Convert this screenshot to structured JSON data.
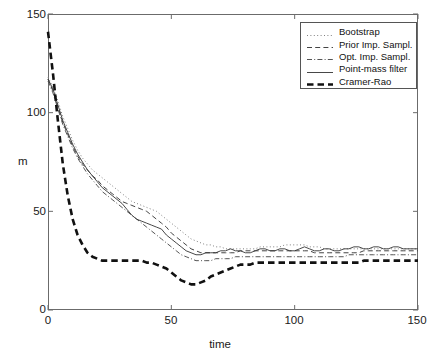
{
  "chart_data": {
    "type": "line",
    "title": "",
    "xlabel": "time",
    "ylabel": "m",
    "xlim": [
      0,
      150
    ],
    "ylim": [
      0,
      150
    ],
    "xticks": [
      0,
      50,
      100,
      150
    ],
    "yticks": [
      0,
      50,
      100,
      150
    ],
    "grid": false,
    "legend_position": "top-right",
    "x": [
      0,
      2,
      4,
      6,
      8,
      10,
      12,
      14,
      16,
      18,
      20,
      22,
      24,
      26,
      28,
      30,
      32,
      34,
      36,
      38,
      40,
      42,
      44,
      46,
      48,
      50,
      52,
      54,
      56,
      58,
      60,
      62,
      64,
      66,
      68,
      70,
      72,
      74,
      76,
      78,
      80,
      82,
      84,
      86,
      88,
      90,
      92,
      94,
      96,
      98,
      100,
      102,
      104,
      106,
      108,
      110,
      112,
      114,
      116,
      118,
      120,
      122,
      124,
      126,
      128,
      130,
      132,
      134,
      136,
      138,
      140,
      142,
      144,
      146,
      148,
      150
    ],
    "series": [
      {
        "name": "Bootstrap",
        "style": "dotted",
        "color": "#808080",
        "values": [
          118,
          113,
          106,
          98,
          92,
          86,
          81,
          77,
          74,
          71,
          69,
          67,
          65,
          63,
          61,
          59,
          57,
          55,
          54,
          53,
          52,
          51,
          50,
          48,
          46,
          44,
          42,
          40,
          38,
          36,
          35,
          34,
          33,
          33,
          32,
          32,
          31,
          31,
          31,
          31,
          31,
          31,
          31,
          32,
          32,
          32,
          32,
          32,
          33,
          33,
          33,
          33,
          33,
          32,
          32,
          32,
          31,
          31,
          31,
          31,
          31,
          31,
          31,
          31,
          31,
          31,
          31,
          31,
          31,
          31,
          31,
          31,
          31,
          31,
          31,
          31
        ]
      },
      {
        "name": "Prior Imp. Sampl.",
        "style": "dashed",
        "color": "#444444",
        "values": [
          117,
          111,
          103,
          95,
          89,
          83,
          78,
          74,
          71,
          68,
          66,
          63,
          61,
          59,
          57,
          55,
          54,
          53,
          52,
          51,
          50,
          48,
          46,
          44,
          42,
          39,
          37,
          35,
          33,
          31,
          30,
          29,
          29,
          29,
          29,
          29,
          29,
          29,
          29,
          30,
          30,
          30,
          30,
          30,
          30,
          30,
          30,
          30,
          30,
          30,
          30,
          30,
          30,
          30,
          29,
          29,
          29,
          29,
          29,
          29,
          29,
          29,
          29,
          29,
          30,
          30,
          30,
          30,
          30,
          30,
          30,
          30,
          30,
          30,
          30,
          30
        ]
      },
      {
        "name": "Opt. Imp. Sampl.",
        "style": "dashdot",
        "color": "#555555",
        "values": [
          116,
          110,
          102,
          94,
          88,
          82,
          77,
          73,
          69,
          66,
          63,
          60,
          58,
          56,
          54,
          52,
          50,
          48,
          46,
          44,
          42,
          40,
          38,
          36,
          34,
          32,
          30,
          28,
          27,
          26,
          25,
          25,
          25,
          25,
          26,
          26,
          26,
          26,
          27,
          27,
          27,
          27,
          27,
          27,
          27,
          27,
          27,
          27,
          27,
          27,
          27,
          27,
          27,
          27,
          27,
          27,
          27,
          27,
          27,
          27,
          27,
          28,
          28,
          28,
          28,
          28,
          28,
          28,
          28,
          28,
          28,
          28,
          28,
          28,
          28,
          28
        ]
      },
      {
        "name": "Point-mass filter",
        "style": "solid",
        "color": "#333333",
        "values": [
          117,
          112,
          104,
          96,
          90,
          84,
          79,
          75,
          71,
          68,
          65,
          62,
          60,
          58,
          56,
          54,
          51,
          48,
          46,
          45,
          44,
          43,
          42,
          41,
          38,
          36,
          34,
          32,
          30,
          29,
          28,
          28,
          29,
          29,
          29,
          30,
          30,
          31,
          30,
          30,
          29,
          29,
          30,
          31,
          31,
          30,
          30,
          31,
          31,
          30,
          30,
          31,
          32,
          31,
          30,
          30,
          31,
          31,
          30,
          30,
          31,
          31,
          32,
          32,
          31,
          31,
          32,
          32,
          31,
          31,
          32,
          32,
          31,
          31,
          31,
          31
        ]
      },
      {
        "name": "Cramer-Rao",
        "style": "bold-dashed",
        "color": "#111111",
        "values": [
          141,
          120,
          96,
          74,
          58,
          46,
          38,
          33,
          29,
          27,
          26,
          25,
          25,
          25,
          25,
          25,
          25,
          25,
          25,
          25,
          24,
          24,
          23,
          22,
          21,
          19,
          17,
          15,
          14,
          13,
          13,
          14,
          15,
          17,
          18,
          19,
          20,
          21,
          22,
          23,
          23,
          23,
          24,
          24,
          24,
          24,
          24,
          24,
          24,
          24,
          24,
          24,
          24,
          24,
          24,
          24,
          24,
          24,
          24,
          24,
          24,
          24,
          24,
          24,
          25,
          25,
          25,
          25,
          25,
          25,
          25,
          25,
          25,
          25,
          25,
          25
        ]
      }
    ]
  },
  "axes": {
    "ytick_labels": [
      "150",
      "100",
      "50",
      "0"
    ],
    "xtick_labels": [
      "0",
      "50",
      "100",
      "150"
    ],
    "ylabel_text": "m",
    "xlabel_text": "time"
  },
  "legend": {
    "items": [
      {
        "label": "Bootstrap",
        "style": "dotted"
      },
      {
        "label": "Prior Imp. Sampl.",
        "style": "dashed"
      },
      {
        "label": "Opt. Imp. Sampl.",
        "style": "dashdot"
      },
      {
        "label": "Point-mass filter",
        "style": "solid"
      },
      {
        "label": "Cramer-Rao",
        "style": "bold-dashed"
      }
    ]
  }
}
